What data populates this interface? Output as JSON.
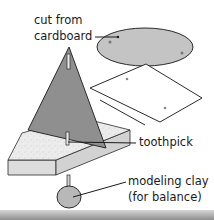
{
  "diagram": {
    "labels": {
      "cut_from_line1": "cut from",
      "cut_from_line2": "cardboard",
      "toothpick": "toothpick",
      "clay_line1": "modeling clay",
      "clay_line2": "(for balance)"
    },
    "colors": {
      "triangle": "#8f8f8f",
      "ellipse": "#c4c4c4",
      "square": "#ffffff",
      "base_top": "#ececec",
      "base_side": "#d8d8d8",
      "clay": "#b8b8b8",
      "ground": "#9a9a9a",
      "outline": "#2a2a2a"
    }
  }
}
